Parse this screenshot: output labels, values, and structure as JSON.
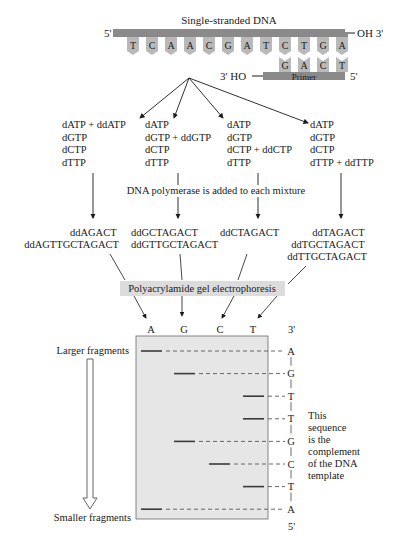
{
  "template": {
    "title": "Single-stranded DNA",
    "end_5": "5'",
    "end_3": "OH 3'",
    "bases": [
      "T",
      "C",
      "A",
      "A",
      "C",
      "G",
      "A",
      "T",
      "C",
      "T",
      "G",
      "A"
    ]
  },
  "primer": {
    "label": "Primer",
    "end_3": "3' HO",
    "end_5": "5'",
    "bases": [
      "G",
      "A",
      "C",
      "T"
    ]
  },
  "mixtures": [
    {
      "lines": [
        "dATP + ddATP",
        "dGTP",
        "dCTP",
        "dTTP"
      ]
    },
    {
      "lines": [
        "dATP",
        "dGTP + ddGTP",
        "dCTP",
        "dTTP"
      ]
    },
    {
      "lines": [
        "dATP",
        "dGTP",
        "dCTP + ddCTP",
        "dTTP"
      ]
    },
    {
      "lines": [
        "dATP",
        "dGTP",
        "dCTP",
        "dTTP + ddTTP"
      ]
    }
  ],
  "polymerase_note": "DNA polymerase is added to each mixture",
  "products": [
    {
      "lines": [
        "ddAGACT",
        "ddAGTTGCTAGACT"
      ]
    },
    {
      "lines": [
        "ddGCTAGACT",
        "ddGTTGCTAGACT"
      ]
    },
    {
      "lines": [
        "ddCTAGACT"
      ]
    },
    {
      "lines": [
        "ddTAGACT",
        "ddTGCTAGACT",
        "ddTTGCTAGACT"
      ]
    }
  ],
  "electrophoresis_label": "Polyacrylamide gel electrophoresis",
  "gel": {
    "lanes": [
      "A",
      "G",
      "C",
      "T"
    ],
    "top_end": "3'",
    "bottom_end": "5'",
    "read_sequence": [
      "A",
      "G",
      "T",
      "T",
      "G",
      "C",
      "T",
      "A"
    ],
    "larger_label": "Larger fragments",
    "smaller_label": "Smaller fragments",
    "note_lines": [
      "This",
      "sequence",
      "is the",
      "complement",
      "of the DNA",
      "template"
    ]
  },
  "colors": {
    "strand": "#8a8a8a",
    "base_tab": "#b9b9b9",
    "gel_bg": "#e6e6e6",
    "label_bg": "#dcdcdc",
    "band": "#3a3a3a"
  }
}
